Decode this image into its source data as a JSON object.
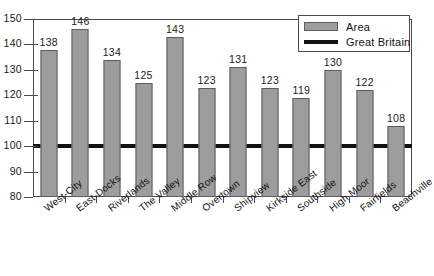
{
  "chart_data": {
    "type": "bar",
    "title": "",
    "xlabel": "",
    "ylabel": "",
    "ylim": [
      80,
      150
    ],
    "ytick_step": 10,
    "yticks": [
      150,
      140,
      130,
      120,
      110,
      100,
      90,
      80
    ],
    "grid": false,
    "legend_position": "top-right",
    "categories": [
      "West-City",
      "East-Docks",
      "Riverlands",
      "The Valley",
      "Middle Row",
      "Overtown",
      "Shipview",
      "Kirkside East",
      "Southside",
      "High Moor",
      "Fairfields",
      "Beachville"
    ],
    "series": [
      {
        "name": "Area",
        "type": "bar",
        "color": "#9d9d9d",
        "edge_color": "#5d5d5d",
        "values": [
          138,
          146,
          134,
          125,
          143,
          123,
          131,
          123,
          119,
          130,
          122,
          108
        ]
      },
      {
        "name": "Great Britain",
        "type": "reference-line",
        "color": "#111111",
        "value": 100
      }
    ],
    "legend": [
      {
        "label": "Area",
        "marker": "bar-swatch"
      },
      {
        "label": "Great Britain",
        "marker": "line-swatch"
      }
    ]
  }
}
